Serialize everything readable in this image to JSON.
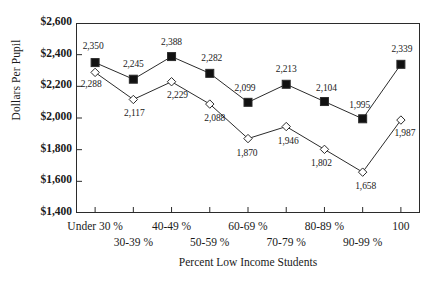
{
  "chart_data": {
    "type": "line",
    "title": "",
    "xlabel": "Percent Low Income Students",
    "ylabel": "Dollars Per Pupil",
    "ylim": [
      1400,
      2600
    ],
    "ytick_labels": [
      "$2,600",
      "$2,400",
      "$2,200",
      "$2,000",
      "$1,800",
      "$1,600",
      "$1,400"
    ],
    "ytick_values": [
      2600,
      2400,
      2200,
      2000,
      1800,
      1600,
      1400
    ],
    "grid": false,
    "legend": "none",
    "categories": [
      "Under 30 %",
      "30-39 %",
      "40-49 %",
      "50-59 %",
      "60-69 %",
      "70-79 %",
      "80-89 %",
      "90-99 %",
      "100"
    ],
    "series": [
      {
        "name": "upper-series",
        "marker": "filled-square",
        "values": [
          2350,
          2245,
          2388,
          2282,
          2099,
          2213,
          2104,
          1995,
          2339
        ],
        "labels": [
          "2,350",
          "2,245",
          "2,388",
          "2,282",
          "2,099",
          "2,213",
          "2,104",
          "1,995",
          "2,339"
        ]
      },
      {
        "name": "lower-series",
        "marker": "open-diamond",
        "values": [
          2288,
          2117,
          2229,
          2088,
          1870,
          1946,
          1802,
          1658,
          1987
        ],
        "labels": [
          "2,288",
          "2,117",
          "2,229",
          "2,088",
          "1,870",
          "1,946",
          "1,802",
          "1,658",
          "1,987"
        ]
      }
    ],
    "colors": {
      "line": "#2b2b2b",
      "marker_fill_upper": "#111111",
      "marker_fill_lower": "#ffffff",
      "axis": "#2b2b2b",
      "background": "#ffffff",
      "text": "#1a1a1a"
    }
  }
}
